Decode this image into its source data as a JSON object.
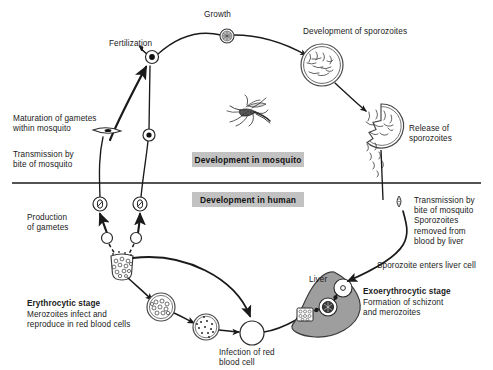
{
  "diagram": {
    "type": "cycle-diagram",
    "colors": {
      "ink": "#1a1a1a",
      "band_fill": "#c2c2c2",
      "liver_fill": "#9e9e9e",
      "cell_fill": "#ffffff"
    },
    "divider": {
      "name": "mosquito-human-divider",
      "y": 183
    },
    "bands": [
      {
        "id": "mosquito",
        "label": "Development in mosquito",
        "x": 192,
        "y": 152,
        "w": 112,
        "h": 15
      },
      {
        "id": "human",
        "label": "Development in human",
        "x": 192,
        "y": 192,
        "w": 112,
        "h": 15
      }
    ],
    "labels": [
      {
        "id": "growth",
        "text": "Growth",
        "x": 204,
        "y": 10,
        "bold": false
      },
      {
        "id": "fertilization",
        "text": "Fertilization",
        "x": 109,
        "y": 39,
        "bold": false
      },
      {
        "id": "development-of-sporozoites",
        "text": "Development of sporozoites",
        "x": 303,
        "y": 27,
        "bold": false
      },
      {
        "id": "release-of-sporozoites",
        "text": "Release of\nsporozoites",
        "x": 409,
        "y": 124,
        "bold": false
      },
      {
        "id": "maturation-of-gametes",
        "text": "Maturation of gametes\nwithin mosquito",
        "x": 13,
        "y": 114,
        "bold": false
      },
      {
        "id": "transmission-by-bite-left",
        "text": "Transmission by\nbite of mosquito",
        "x": 13,
        "y": 150,
        "bold": false
      },
      {
        "id": "production-of-gametes",
        "text": "Production\nof gametes",
        "x": 27,
        "y": 213,
        "bold": false
      },
      {
        "id": "erythrocytic-stage",
        "text": "Erythrocytic stage",
        "x": 27,
        "y": 299,
        "bold": true
      },
      {
        "id": "erythrocytic-stage-desc",
        "text": "Merozoites infect and\nreproduce in red blood cells",
        "x": 27,
        "y": 310,
        "bold": false
      },
      {
        "id": "infection-of-red-blood-cell",
        "text": "Infection of red\nblood cell",
        "x": 219,
        "y": 348,
        "bold": false
      },
      {
        "id": "transmission-by-bite-right",
        "text": "Transmission by\nbite of mosquito\nSporozoites\nremoved from\nblood by liver",
        "x": 414,
        "y": 196,
        "bold": false
      },
      {
        "id": "sporozoite-enters-liver-cell",
        "text": "Sporozoite enters liver cell",
        "x": 377,
        "y": 261,
        "bold": false
      },
      {
        "id": "liver",
        "text": "Liver",
        "x": 309,
        "y": 275,
        "bold": false
      },
      {
        "id": "exoerythrocytic-stage",
        "text": "Exoerythrocytic stage",
        "x": 363,
        "y": 287,
        "bold": true
      },
      {
        "id": "exoerythrocytic-stage-desc",
        "text": "Formation of schizont\nand merozoites",
        "x": 363,
        "y": 298,
        "bold": false
      }
    ],
    "stages": [
      {
        "id": "zygote-growth",
        "name": "oocyst-growth-cell",
        "x": 227,
        "y": 36,
        "r": 7
      },
      {
        "id": "fertilization-zygote",
        "name": "fertilization-zygote-cell",
        "x": 152,
        "y": 57,
        "r": 6.5
      },
      {
        "id": "male-gamete",
        "name": "male-gamete-cell",
        "x": 149,
        "y": 135,
        "r": 6
      },
      {
        "id": "female-gamete",
        "name": "female-gamete-cell",
        "x": 107,
        "y": 131,
        "r": 6
      },
      {
        "id": "oocyst-sporozoites",
        "name": "oocyst-with-sporozoites",
        "x": 322,
        "y": 65,
        "r": 21
      },
      {
        "id": "ruptured-oocyst",
        "name": "ruptured-oocyst-releasing-sporozoites",
        "x": 381,
        "y": 126,
        "r": 22
      },
      {
        "id": "gametocyte-left",
        "name": "gametocyte-cell-left",
        "x": 100,
        "y": 204,
        "r": 7
      },
      {
        "id": "gametocyte-right",
        "name": "gametocyte-cell-right",
        "x": 140,
        "y": 204,
        "r": 7
      },
      {
        "id": "merozoite-left",
        "name": "merozoite-cell-left",
        "x": 107,
        "y": 238,
        "r": 5.5
      },
      {
        "id": "merozoite-right",
        "name": "merozoite-cell-right",
        "x": 136,
        "y": 238,
        "r": 5.5
      },
      {
        "id": "ruptured-rbc",
        "name": "ruptured-red-blood-cell",
        "x": 122,
        "y": 266,
        "r": 12
      },
      {
        "id": "schizont-rbc",
        "name": "schizont-in-red-blood-cell",
        "x": 161,
        "y": 307,
        "r": 14
      },
      {
        "id": "trophozoite-rbc",
        "name": "trophozoite-in-red-blood-cell",
        "x": 206,
        "y": 327,
        "r": 13
      },
      {
        "id": "healthy-rbc",
        "name": "uninfected-red-blood-cell",
        "x": 252,
        "y": 333,
        "r": 12
      },
      {
        "id": "liver-cell-nucleus",
        "name": "liver-cell-uninfected",
        "x": 343,
        "y": 288,
        "r": 9
      },
      {
        "id": "liver-schizont",
        "name": "liver-cell-schizont",
        "x": 328,
        "y": 307,
        "r": 9
      },
      {
        "id": "liver-merozoites",
        "name": "liver-merozoite-packet",
        "x": 305,
        "y": 315,
        "r": 9
      }
    ],
    "mosquito_illustration": {
      "name": "mosquito-illustration",
      "x": 248,
      "y": 111
    }
  }
}
